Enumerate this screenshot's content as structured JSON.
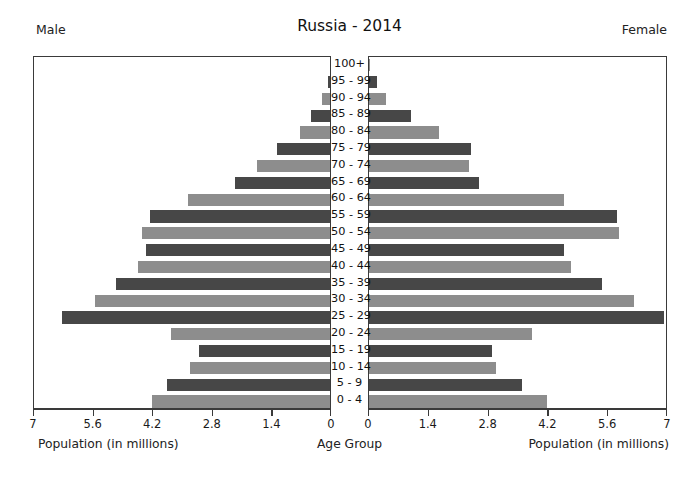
{
  "header": {
    "title": "Russia - 2014",
    "left_label": "Male",
    "right_label": "Female"
  },
  "footer": {
    "left_axis_title": "Population (in millions)",
    "center_axis_title": "Age Group",
    "right_axis_title": "Population (in millions)"
  },
  "colors": {
    "bar_dark": "#474747",
    "bar_light": "#8d8d8d",
    "axis": "#3a3a3a",
    "background": "#ffffff",
    "text": "#1a1a1a"
  },
  "chart_data": {
    "type": "bar",
    "subtype": "population-pyramid",
    "title": "Russia - 2014",
    "xlabel": "Population (in millions)",
    "ylabel": "Age Group",
    "grid": false,
    "legend": [
      "Male",
      "Female"
    ],
    "legend_position": "top-corners",
    "xlim_left": [
      7,
      0
    ],
    "xlim_right": [
      0,
      7
    ],
    "left_ticks": [
      "7",
      "5.6",
      "4.2",
      "2.8",
      "1.4",
      "0"
    ],
    "right_ticks": [
      "0",
      "1.4",
      "2.8",
      "4.2",
      "5.6",
      "7"
    ],
    "tick_values": [
      0,
      1.4,
      2.8,
      4.2,
      5.6,
      7
    ],
    "categories": [
      "100+",
      "95 - 99",
      "90 - 94",
      "85 - 89",
      "80 - 84",
      "75 - 79",
      "70 - 74",
      "65 - 69",
      "60 - 64",
      "55 - 59",
      "50 - 54",
      "45 - 49",
      "40 - 44",
      "35 - 39",
      "30 - 34",
      "25 - 29",
      "20 - 24",
      "15 - 19",
      "10 - 14",
      "5 - 9",
      "0 - 4"
    ],
    "series": [
      {
        "name": "Male",
        "side": "left",
        "values": [
          0.01,
          0.05,
          0.18,
          0.45,
          0.72,
          1.25,
          1.73,
          2.25,
          3.35,
          4.25,
          4.45,
          4.35,
          4.55,
          5.05,
          5.55,
          6.35,
          3.75,
          3.1,
          3.3,
          3.85,
          4.2
        ]
      },
      {
        "name": "Female",
        "side": "right",
        "values": [
          0.03,
          0.18,
          0.4,
          1.0,
          1.65,
          2.4,
          2.35,
          2.6,
          4.6,
          5.85,
          5.9,
          4.6,
          4.75,
          5.5,
          6.25,
          6.95,
          3.85,
          2.9,
          3.0,
          3.6,
          4.2
        ]
      }
    ]
  }
}
